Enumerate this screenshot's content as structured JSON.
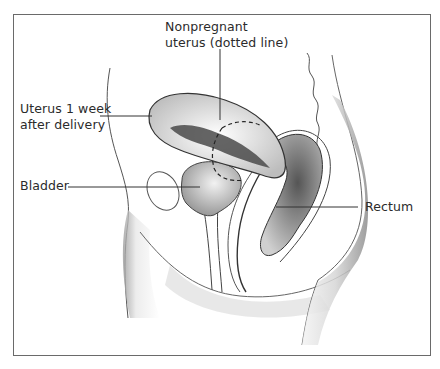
{
  "figure": {
    "labels": {
      "nonpregnant_uterus": [
        "Nonpregnant",
        "uterus (dotted line)"
      ],
      "uterus_postpartum": [
        "Uterus 1 week",
        "after delivery"
      ],
      "bladder": "Bladder",
      "rectum": "Rectum"
    }
  }
}
